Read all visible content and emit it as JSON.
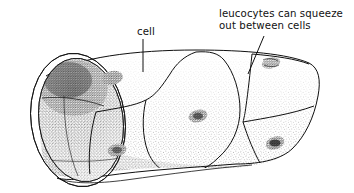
{
  "figure": {
    "title": "cell",
    "domain": "biological-diagram",
    "style": "pen-and-ink stipple line drawing",
    "background_color": "#ffffff",
    "ink_color": "#101010",
    "canvas": {
      "width": 354,
      "height": 193
    }
  },
  "annotations": [
    {
      "id": "cell-label",
      "text": "cell",
      "lines": [
        "cell"
      ],
      "align": "middle",
      "x": 146,
      "y": 34,
      "leader": {
        "type": "straight-vertical",
        "x1": 143,
        "y1": 39,
        "x2": 143,
        "y2": 72
      }
    },
    {
      "id": "leucocyte-label",
      "text": "leucocytes can squeeze out between cells",
      "lines": [
        "leucocytes can squeeze",
        "out between cells"
      ],
      "align": "start",
      "x": 219,
      "y": 16,
      "leader": {
        "type": "straight-diagonal",
        "x1": 264,
        "y1": 36,
        "x2": 248,
        "y2": 74
      }
    }
  ],
  "features": {
    "vessel": {
      "name": "blood-vessel-tube",
      "open_end": "left",
      "lumen_shading": "dark stipple gradient, darkest upper-left"
    },
    "nuclei": [
      {
        "name": "nucleus-upper-left",
        "cx": 112,
        "cy": 78,
        "rx": 10,
        "ry": 6.5,
        "angle": -12
      },
      {
        "name": "nucleus-lower-left",
        "cx": 117,
        "cy": 150,
        "rx": 9,
        "ry": 6,
        "angle": -10
      },
      {
        "name": "nucleus-center",
        "cx": 198,
        "cy": 116,
        "rx": 9,
        "ry": 6,
        "angle": -14
      },
      {
        "name": "nucleus-right",
        "cx": 275,
        "cy": 143,
        "rx": 9,
        "ry": 6,
        "angle": -18
      }
    ],
    "leucocyte_squeeze": {
      "name": "leucocyte-squeezing-through",
      "cx": 271,
      "cy": 63,
      "rx": 9,
      "ry": 5
    }
  }
}
